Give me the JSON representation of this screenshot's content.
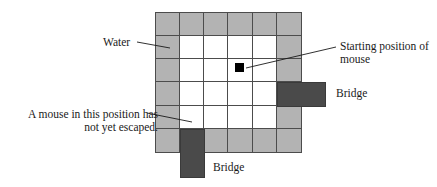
{
  "figure": {
    "colors": {
      "water": "#b3b3b3",
      "land": "#ffffff",
      "bridge": "#4a4a4a",
      "gridline": "#4c4c4c",
      "marker": "#000000",
      "text": "#1a1a1a"
    }
  },
  "grid": {
    "columns": 6,
    "rows": 6,
    "legend": {
      "water": "water",
      "land": "land"
    },
    "cells": [
      [
        "water",
        "water",
        "water",
        "water",
        "water",
        "water"
      ],
      [
        "water",
        "land",
        "land",
        "land",
        "land",
        "water"
      ],
      [
        "water",
        "land",
        "land",
        "land",
        "land",
        "water"
      ],
      [
        "water",
        "land",
        "land",
        "land",
        "land",
        "water"
      ],
      [
        "water",
        "land",
        "land",
        "land",
        "land",
        "water"
      ],
      [
        "water",
        "water",
        "water",
        "water",
        "water",
        "water"
      ]
    ]
  },
  "markers": {
    "mouse_start": {
      "name": "starting position of mouse",
      "row": 3,
      "col": 4
    }
  },
  "bridges": [
    {
      "id": "bridge-right",
      "label": "Bridge",
      "row": 4,
      "col": 6,
      "direction": "east"
    },
    {
      "id": "bridge-bottom",
      "label": "Bridge",
      "row": 6,
      "col": 2,
      "direction": "south"
    }
  ],
  "labels": {
    "water": "Water",
    "starting_position": "Starting position of mouse",
    "not_escaped": "A mouse in this position has not yet escaped.",
    "bridge_right": "Bridge",
    "bridge_bottom": "Bridge"
  }
}
